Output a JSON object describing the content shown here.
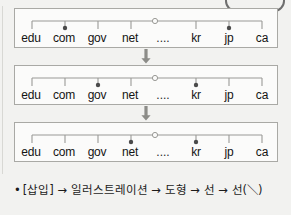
{
  "figure": {
    "tld_labels": [
      "edu",
      "com",
      "gov",
      "net",
      "....",
      "kr",
      "jp",
      "ca"
    ],
    "root_marker": "root-node-circle",
    "arrow_glyph": "down-arrow",
    "diagrams": [
      {
        "name": "dns-tree-step-1",
        "highlighted": [
          "com",
          "jp"
        ],
        "spine_from": "edu",
        "spine_to": "ca",
        "root_index": 4
      },
      {
        "name": "dns-tree-step-2",
        "highlighted": [
          "gov",
          "kr"
        ],
        "spine_from": "edu",
        "spine_to": "ca",
        "root_index": 4
      },
      {
        "name": "dns-tree-step-3",
        "highlighted": [
          "net",
          "kr"
        ],
        "spine_from": "edu",
        "spine_to": "ca",
        "root_index": 4
      }
    ]
  },
  "caption": {
    "bullet": "•",
    "text": "[삽입] → 일러스트레이션 → 도형 → 선 → 선(＼)"
  },
  "colors": {
    "page_background": "#f2f2f0",
    "box_background": "#fbfbfa",
    "box_border": "#a9a9a5",
    "line": "#9a9a96",
    "dot_fill": "#4a4a4a",
    "text": "#141414",
    "callout_border": "#6e6e6e"
  }
}
